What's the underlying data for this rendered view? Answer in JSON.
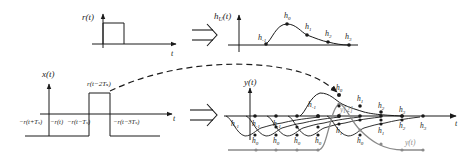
{
  "figure": {
    "type": "signal-superposition-diagram",
    "colors": {
      "ink": "#1a1a1a",
      "gray": "#8a8a8a",
      "background": "#ffffff"
    }
  },
  "panel_r": {
    "ylabel": "r(t)",
    "xlabel": "t",
    "shape": "rectangular pulse"
  },
  "panel_h": {
    "ylabel": "h_U(t)",
    "xlabel": "t",
    "samples": [
      "h-1",
      "h0",
      "h1",
      "h2",
      "h3"
    ],
    "labels": {
      "hm1": "h",
      "hm1_sub": "-1",
      "h0": "h",
      "h0_sub": "0",
      "h1": "h",
      "h1_sub": "1",
      "h2": "h",
      "h2_sub": "2",
      "h3": "h",
      "h3_sub": "3"
    }
  },
  "panel_x": {
    "ylabel": "x(t)",
    "xlabel": "t",
    "pulse_label": "r(t−2Tₛ)",
    "below_labels": [
      "−r(t+Tₛ)",
      "−r(t)",
      "−r(t−Tₛ)",
      "−r(t−3Tₛ)"
    ]
  },
  "panel_y": {
    "ylabel": "y(t)",
    "xlabel": "t",
    "inner_label": "y[2]",
    "output_label": "y(t)",
    "top_labels": [
      "h-1",
      "h0",
      "h1",
      "h2",
      "h3"
    ],
    "axis_labels": [
      "h-1",
      "h-1",
      "h-1",
      "h-1",
      "h2",
      "h3"
    ],
    "lower_labels": [
      "h0",
      "h0",
      "h0",
      "h0",
      "h1",
      "h0",
      "h1",
      "h2"
    ]
  },
  "arrows": {
    "implies_1": "⇒",
    "implies_2": "⇒"
  }
}
